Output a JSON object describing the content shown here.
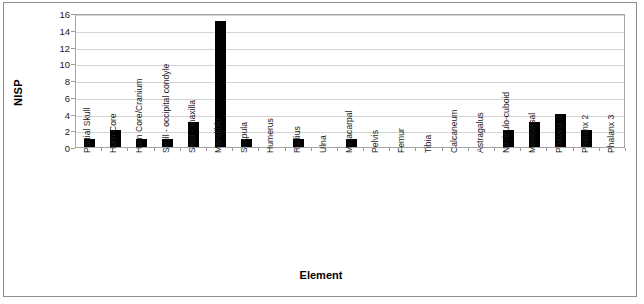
{
  "chart_data": {
    "type": "bar",
    "title": "",
    "xlabel": "Element",
    "ylabel": "NISP",
    "ylim": [
      0,
      16
    ],
    "y_tick_step": 2,
    "y_tick_labels": [
      "0",
      "2",
      "4",
      "6",
      "8",
      "10",
      "12",
      "14",
      "16"
    ],
    "grid": "horizontal",
    "legend": "none",
    "bar_color": "#000000",
    "plot_border_color": "#a6a6a6",
    "gridline_color": "#d4d4d4",
    "frame_color": "#8d8d8d",
    "categories": [
      "Partial Skull",
      "Horn Core",
      "Horn Core/Cranium",
      "Skull - occipital condyle",
      "Skull - maxilla",
      "Mandible",
      "Scapula",
      "Humerus",
      "Radius",
      "Ulna",
      "Metacarpal",
      "Pelvis",
      "Femur",
      "Tibia",
      "Calcaneum",
      "Astragalus",
      "Naviculo-cuboid",
      "Metatarsal",
      "Phalanx 1",
      "Phalanx 2",
      "Phalanx 3"
    ],
    "values": [
      1,
      2,
      1,
      1,
      3,
      15,
      1,
      0,
      1,
      0,
      1,
      0,
      0,
      0,
      0,
      0,
      2,
      3,
      4,
      2,
      0
    ]
  }
}
